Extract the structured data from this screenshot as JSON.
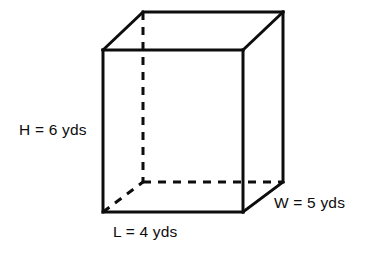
{
  "figure": {
    "background_color": "#ffffff",
    "stroke_color": "#0d0d0d",
    "stroke_width": 3,
    "dashed_stroke_width": 3,
    "dash_pattern": "8 7"
  },
  "labels": {
    "height": "H = 6 yds",
    "length": "L = 4 yds",
    "width": "W = 5 yds"
  },
  "measurements": {
    "height_value": 6,
    "length_value": 4,
    "width_value": 5,
    "unit": "yds"
  },
  "geometry": {
    "shape": "rectangular prism",
    "front_face": {
      "top_left": [
        103,
        50
      ],
      "top_right": [
        243,
        50
      ],
      "bottom_right": [
        243,
        212
      ],
      "bottom_left": [
        103,
        212
      ]
    },
    "back_face": {
      "top_left": [
        143,
        12
      ],
      "top_right": [
        283,
        12
      ],
      "bottom_right": [
        283,
        182
      ],
      "bottom_left": [
        143,
        182
      ]
    },
    "hidden_edges": [
      "back-bottom-left vertical",
      "back-bottom horizontal",
      "front-bottom-left to back-bottom-left diagonal"
    ]
  }
}
